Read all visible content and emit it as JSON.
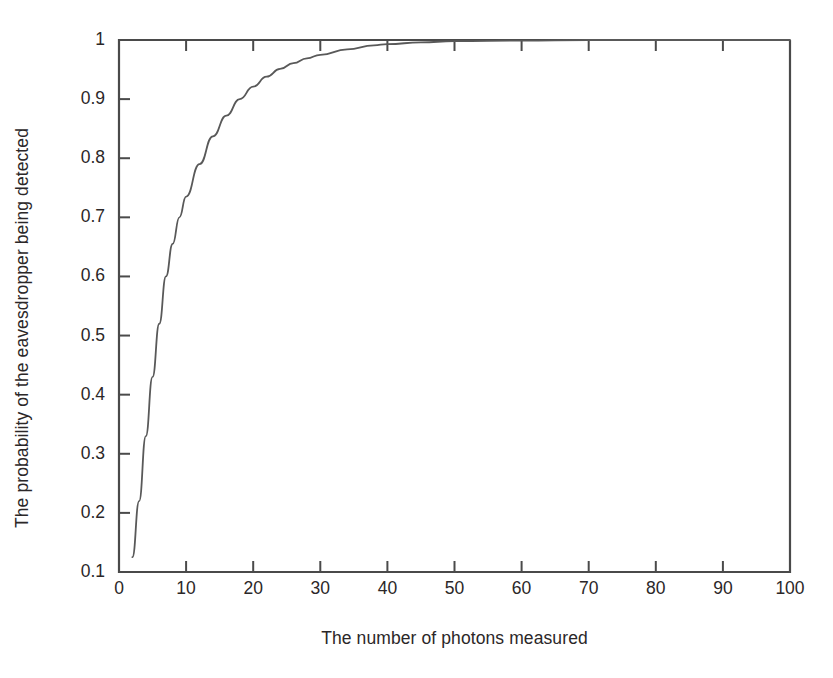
{
  "figure": {
    "background_color": "#ffffff",
    "axis_color": "#4a4a4a",
    "curve_color": "#595959",
    "text_color": "#2b2728"
  },
  "chart_data": {
    "type": "line",
    "title": "",
    "subtitle": "",
    "xlabel": "The number of photons measured",
    "ylabel": "The probability of the eavesdropper being detected",
    "xlim": [
      0,
      100
    ],
    "ylim": [
      0.1,
      1
    ],
    "xticks": [
      0,
      10,
      20,
      30,
      40,
      50,
      60,
      70,
      80,
      90,
      100
    ],
    "xtick_labels": [
      "0",
      "10",
      "20",
      "30",
      "40",
      "50",
      "60",
      "70",
      "80",
      "90",
      "100"
    ],
    "yticks": [
      0.1,
      0.2,
      0.3,
      0.4,
      0.5,
      0.6,
      0.7,
      0.8,
      0.9,
      1
    ],
    "ytick_labels": [
      "0.1",
      "0.2",
      "0.3",
      "0.4",
      "0.5",
      "0.6",
      "0.7",
      "0.8",
      "0.9",
      "1"
    ],
    "grid": false,
    "legend": false,
    "legend_position": "none",
    "annotations": [],
    "series": [
      {
        "name": "Probability of detecting eavesdropper",
        "x": [
          2,
          3,
          4,
          5,
          6,
          7,
          8,
          9,
          10,
          12,
          14,
          16,
          18,
          20,
          22,
          24,
          26,
          28,
          30,
          34,
          38,
          40,
          45,
          50,
          60,
          70,
          80,
          90,
          100
        ],
        "values": [
          0.125,
          0.22,
          0.33,
          0.43,
          0.52,
          0.6,
          0.655,
          0.7,
          0.735,
          0.79,
          0.837,
          0.872,
          0.9,
          0.921,
          0.938,
          0.951,
          0.961,
          0.969,
          0.975,
          0.984,
          0.991,
          0.993,
          0.996,
          0.998,
          0.999,
          1.0,
          1.0,
          1.0,
          1.0
        ]
      }
    ]
  }
}
